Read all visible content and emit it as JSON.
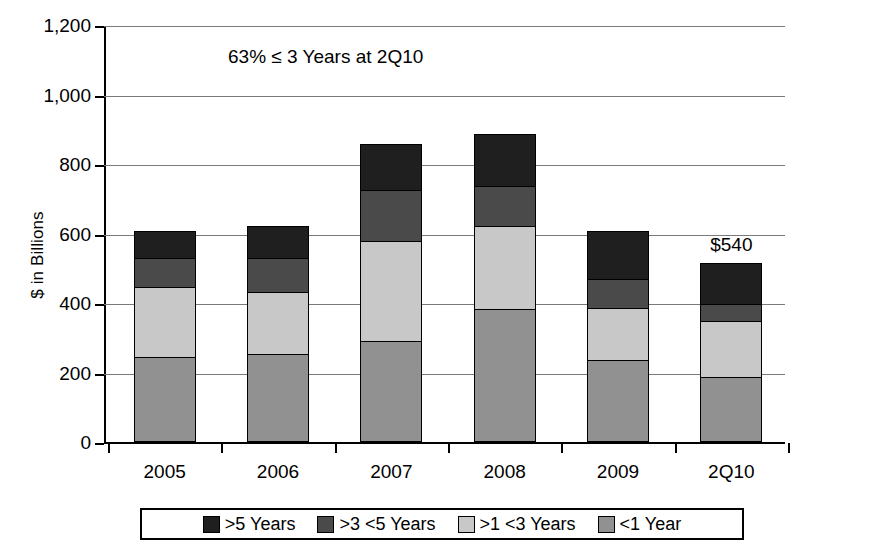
{
  "chart_data": {
    "type": "bar",
    "subtype": "stacked-bar",
    "title": "",
    "xlabel": "",
    "ylabel": "$ in Billions",
    "ylim": [
      0,
      1200
    ],
    "ytick_values": [
      0,
      200,
      400,
      600,
      800,
      1000,
      1200
    ],
    "ytick_labels": [
      "0",
      "200",
      "400",
      "600",
      "800",
      "1,000",
      "1,200"
    ],
    "grid": true,
    "legend_position": "bottom",
    "categories": [
      "2005",
      "2006",
      "2007",
      "2008",
      "2009",
      "2Q10"
    ],
    "series": [
      {
        "name": "<1 Year",
        "color": "#919191",
        "values": [
          245,
          252,
          292,
          383,
          235,
          188
        ]
      },
      {
        "name": ">1 <3 Years",
        "color": "#c8c8c8",
        "values": [
          203,
          183,
          290,
          242,
          153,
          162
        ]
      },
      {
        "name": ">3 <5 Years",
        "color": "#4a4a4a",
        "values": [
          88,
          100,
          150,
          118,
          87,
          53
        ]
      },
      {
        "name": ">5 Years",
        "color": "#1f1f1f",
        "values": [
          79,
          95,
          133,
          153,
          141,
          122
        ]
      }
    ],
    "totals": [
      615,
      630,
      865,
      896,
      616,
      525
    ],
    "annotations": [
      {
        "text": "63% ≤ 3 Years at 2Q10",
        "x": "2007",
        "y": 1090
      }
    ],
    "data_labels": [
      {
        "category": "2Q10",
        "text": "$540"
      }
    ]
  },
  "axes": {
    "y_title": "$ in Billions"
  },
  "legend": {
    "items": [
      {
        "label": ">5 Years",
        "color": "#1f1f1f"
      },
      {
        "label": ">3 <5 Years",
        "color": "#4a4a4a"
      },
      {
        "label": ">1 <3 Years",
        "color": "#c8c8c8"
      },
      {
        "label": "<1 Year",
        "color": "#919191"
      }
    ]
  }
}
